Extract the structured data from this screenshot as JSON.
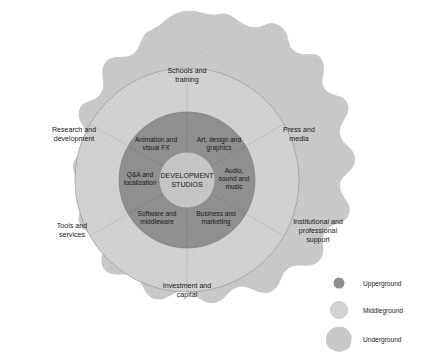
{
  "diagram": {
    "type": "concentric-ecosystem",
    "core": {
      "label_line1": "DEVELOPMENT",
      "label_line2": "STUDIOS"
    },
    "upperground": {
      "name": "Upperground",
      "color": "#8f8f8f",
      "segments": [
        {
          "id": "animation-visual-fx",
          "line1": "Animation and",
          "line2": "visual FX"
        },
        {
          "id": "art-design-graphics",
          "line1": "Art, design and",
          "line2": "graphics"
        },
        {
          "id": "audio-sound-music",
          "line1": "Audio,",
          "line2": "sound and",
          "line3": "music"
        },
        {
          "id": "business-marketing",
          "line1": "Business and",
          "line2": "marketing"
        },
        {
          "id": "software-middleware",
          "line1": "Software and",
          "line2": "middleware"
        },
        {
          "id": "qa-localization",
          "line1": "Q&A and",
          "line2": "localization"
        }
      ]
    },
    "middleground": {
      "name": "Middleground",
      "color": "#d2d2d2",
      "segments": [
        {
          "id": "schools-training",
          "line1": "Schools and",
          "line2": "training"
        },
        {
          "id": "press-media",
          "line1": "Press and",
          "line2": "media"
        },
        {
          "id": "institutional-professional-support",
          "line1": "Institutional and",
          "line2": "professional",
          "line3": "support"
        },
        {
          "id": "investment-capital",
          "line1": "Investment and",
          "line2": "capital"
        },
        {
          "id": "tools-services",
          "line1": "Tools and",
          "line2": "services"
        },
        {
          "id": "research-development",
          "line1": "Research and",
          "line2": "development"
        }
      ]
    },
    "underground": {
      "name": "Underground",
      "color": "#cfcfcf"
    }
  },
  "legend": {
    "items": [
      {
        "id": "legend-upperground",
        "label": "Upperground",
        "color": "#8f8f8f",
        "shape": "small-circle"
      },
      {
        "id": "legend-middleground",
        "label": "Middleground",
        "color": "#d8d8d8",
        "shape": "medium-circle"
      },
      {
        "id": "legend-underground",
        "label": "Underground",
        "color": "#cfcfcf",
        "shape": "blob"
      }
    ]
  }
}
